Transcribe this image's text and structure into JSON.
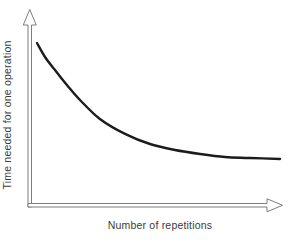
{
  "window": {
    "background": "#ffffff"
  },
  "chart_data": {
    "type": "line",
    "title": "",
    "xlabel": "Number of repetitions",
    "ylabel": "Time needed for one operation",
    "x_ticks": [],
    "y_ticks": [],
    "grid": false,
    "legend": false,
    "axis_style": "hollow-outline-arrows",
    "curve_color": "#1c1c1c",
    "axis_color": "#7d7d7d",
    "label_color": "#3a3a3a",
    "series": [
      {
        "name": "time-per-operation",
        "shape": "hyperbolic-decay",
        "points": [
          [
            0.0,
            1.0
          ],
          [
            0.033,
            0.879
          ],
          [
            0.074,
            0.767
          ],
          [
            0.123,
            0.638
          ],
          [
            0.177,
            0.509
          ],
          [
            0.259,
            0.345
          ],
          [
            0.362,
            0.216
          ],
          [
            0.465,
            0.129
          ],
          [
            0.568,
            0.078
          ],
          [
            0.671,
            0.043
          ],
          [
            0.774,
            0.017
          ],
          [
            0.876,
            0.009
          ],
          [
            1.0,
            0.0
          ]
        ]
      }
    ]
  }
}
